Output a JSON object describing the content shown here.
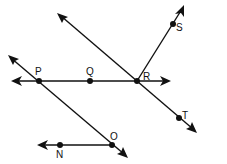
{
  "diagram": {
    "type": "geometry-lines-rays",
    "color": "#111111",
    "points": {
      "P": {
        "label": "P",
        "x": 39,
        "y": 81
      },
      "Q": {
        "label": "Q",
        "x": 90,
        "y": 81
      },
      "R": {
        "label": "R",
        "x": 137,
        "y": 81
      },
      "S": {
        "label": "S",
        "x": 173,
        "y": 24
      },
      "T": {
        "label": "T",
        "x": 179,
        "y": 118
      },
      "O": {
        "label": "O",
        "x": 112,
        "y": 145
      },
      "N": {
        "label": "N",
        "x": 60,
        "y": 145
      }
    },
    "figures": [
      {
        "name": "line-PR",
        "kind": "line",
        "through": [
          "P",
          "Q",
          "R"
        ]
      },
      {
        "name": "line-RT",
        "kind": "line",
        "through": [
          "R",
          "T"
        ]
      },
      {
        "name": "ray-RS",
        "kind": "ray",
        "from": "R",
        "through": "S"
      },
      {
        "name": "line-PO",
        "kind": "line",
        "through": [
          "P",
          "O"
        ]
      },
      {
        "name": "ray-ON",
        "kind": "ray",
        "from": "O",
        "through": "N"
      }
    ]
  }
}
